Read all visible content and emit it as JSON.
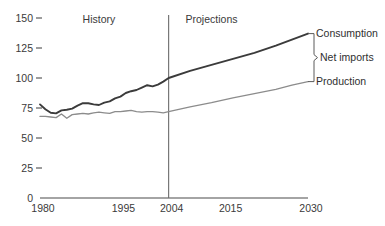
{
  "chart_data": {
    "type": "line",
    "title": "",
    "xlabel": "",
    "ylabel": "",
    "xlim": [
      1980,
      2030
    ],
    "ylim": [
      0,
      150
    ],
    "grid": false,
    "legend_position": "right-endpoint-labels",
    "x_ticks": [
      "1980",
      "1995",
      "2004",
      "2015",
      "2030"
    ],
    "x_tick_values": [
      1980,
      1995,
      2004,
      2015,
      2030
    ],
    "y_ticks": [
      "0",
      "25",
      "50",
      "75",
      "100",
      "125",
      "150"
    ],
    "y_tick_values": [
      0,
      25,
      50,
      75,
      100,
      125,
      150
    ],
    "annotations": [
      {
        "name": "history",
        "text": "History",
        "x": 1991,
        "y": 146
      },
      {
        "name": "projections",
        "text": "Projections",
        "x": 2012,
        "y": 146
      },
      {
        "name": "divider",
        "text": "",
        "x": 2004,
        "y": 0
      }
    ],
    "series": [
      {
        "name": "Consumption",
        "label": "Consumption",
        "color": "#3b3b3b",
        "x": [
          1980,
          1981,
          1982,
          1983,
          1984,
          1985,
          1986,
          1987,
          1988,
          1989,
          1990,
          1991,
          1992,
          1993,
          1994,
          1995,
          1996,
          1997,
          1998,
          1999,
          2000,
          2001,
          2002,
          2003,
          2004,
          2008,
          2012,
          2016,
          2020,
          2024,
          2027,
          2030
        ],
        "values": [
          78,
          74,
          71,
          70.5,
          73,
          73.5,
          74.5,
          77,
          79,
          79,
          78,
          77.5,
          79.5,
          80.5,
          83,
          84.5,
          87.5,
          89,
          90,
          92,
          94,
          93,
          94.5,
          97,
          100,
          106,
          111,
          116,
          121,
          127,
          132,
          137
        ]
      },
      {
        "name": "Production",
        "label": "Production",
        "color": "#8c8c8c",
        "x": [
          1980,
          1981,
          1982,
          1983,
          1984,
          1985,
          1986,
          1987,
          1988,
          1989,
          1990,
          1991,
          1992,
          1993,
          1994,
          1995,
          1996,
          1997,
          1998,
          1999,
          2000,
          2001,
          2002,
          2003,
          2004,
          2008,
          2012,
          2016,
          2020,
          2024,
          2027,
          2030
        ],
        "values": [
          68,
          68,
          67.5,
          67,
          70,
          66.5,
          69.5,
          70,
          70.5,
          70,
          71,
          71.5,
          71,
          70.5,
          72,
          72,
          72.5,
          73,
          72,
          71.5,
          72,
          72,
          71.5,
          71,
          72,
          76,
          79.5,
          83.5,
          87,
          90.5,
          94,
          97
        ]
      }
    ],
    "endpoint_labels": [
      {
        "name": "consumption",
        "text": "Consumption",
        "value": 137
      },
      {
        "name": "net-imports",
        "text": "Net imports",
        "value": 40
      },
      {
        "name": "production",
        "text": "Production",
        "value": 97
      }
    ],
    "bracket": {
      "label": "Net imports",
      "top_value": 137,
      "bottom_value": 97
    }
  }
}
